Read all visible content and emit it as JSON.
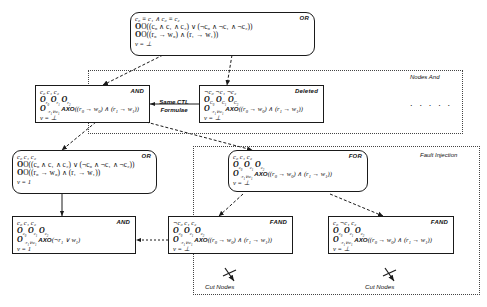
{
  "diagram": {
    "groups": [
      {
        "name": "nodes-and-group",
        "label": "Nodes And"
      },
      {
        "name": "fault-injection-group",
        "label": "Fault Injection"
      }
    ],
    "edge_labels": [
      {
        "name": "same-ctl-formulae-label",
        "line1": "Same CTL",
        "line2": "Formulae"
      }
    ],
    "cut_labels": [
      {
        "name": "cut-nodes-label-left",
        "text": "Cut Nodes"
      },
      {
        "name": "cut-nodes-label-right",
        "text": "Cut Nodes"
      }
    ],
    "ellipsis": ". . . . .",
    "nodes": [
      {
        "id": "root-or",
        "kind": "OR",
        "lines": [
          "c₀ ≡ c₁ ∧ c₀ ≡ c₂",
          "O((c₀ ∧ c₁ ∧ c₂) ∨ (¬c₀ ∧ ¬c₁ ∧ ¬c₂))",
          "O((r₀ → w₀) ∧ (r₁ → w₁))",
          "v = ⊥"
        ]
      },
      {
        "id": "and-top-left",
        "kind": "AND",
        "lines": [
          "c₀ c₁ c₂",
          "O_{r₀} O_{r₁} O_{r₂}",
          "O_{¬r₁∨w₁} AXO((r₀ → w₀) ∧ (r₁ → w₁))",
          "v = ⊥"
        ]
      },
      {
        "id": "deleted-top-right",
        "kind": "Deleted",
        "lines": [
          "¬c₀ ¬c₁ ¬c₂",
          "O_{C₀} O_{C₁} O_{C₂}",
          "O_{¬r₁∨w₁} AXO((r₀ → w₀) ∧ (r₁ → w₁))",
          "v = ⊥"
        ]
      },
      {
        "id": "or-mid-left",
        "kind": "OR",
        "lines": [
          "c₀ c₁ c₂",
          "O((c₀ ∧ c₁ ∧ c₂) ∨ (¬c₀ ∧ ¬c₁ ∧ ¬c₂))",
          "O((r₀ → w₀) ∧ (r₁ → w₁))",
          "v = 1"
        ]
      },
      {
        "id": "and-bottom-left",
        "kind": "AND",
        "lines": [
          "c₀ c₁ c₂",
          "O_{c₀} O_{c₁} O_{c₂}",
          "O_{¬r₁∨w₁} AXO(¬r₁ ∨ w₁)",
          "v = 1"
        ]
      },
      {
        "id": "for-node",
        "kind": "FOR",
        "lines": [
          "c₀ c₁ c₂",
          "O_{c₀} O_{c₁} O_{c₂}",
          "O_{¬r₁∨w₁} AXO((r₀ → w₀) ∧ (r₁ → w₁))",
          "v = ⊥"
        ]
      },
      {
        "id": "fand-left",
        "kind": "FAND",
        "lines": [
          "¬c₀ c₁ c₂",
          "O_{c₀} O_{c₁} O_{c₂}",
          "O_{¬r₁∨w₁} AXO((r₀ → w₀) ∧ (r₁ → w₁))",
          "v = ⊥"
        ]
      },
      {
        "id": "fand-right",
        "kind": "FAND",
        "lines": [
          "c₀ ¬c₁ c₂",
          "O_{c₀} O_{c₁} O_{c₂}",
          "O_{¬r₁∨w₁} AXO((r₀ → w₀) ∧ (r₁ → w₁))",
          "v = ⊥"
        ]
      }
    ],
    "colors": {
      "node_border": "#1a1a1a",
      "group_border": "#444444",
      "background": "#ffffff",
      "text": "#111111"
    }
  }
}
